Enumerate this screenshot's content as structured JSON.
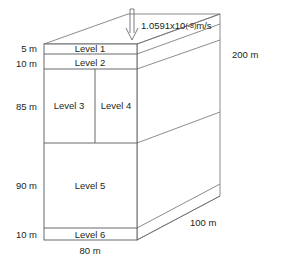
{
  "figure": {
    "type": "3d-box-schematic",
    "title": ""
  },
  "flux": {
    "arrow_icon": "down-arrow-icon",
    "mantissa": "1.0591x10",
    "exponent": "(-8)",
    "unit": "m/s",
    "full_label": "1.0591x10(-8)m/s"
  },
  "levels": [
    {
      "id": "level-1",
      "label": "Level 1",
      "thickness": "5 m"
    },
    {
      "id": "level-2",
      "label": "Level 2",
      "thickness": "10 m"
    },
    {
      "id": "level-3",
      "label": "Level 3",
      "thickness": "85 m"
    },
    {
      "id": "level-4",
      "label": "Level 4",
      "thickness": "85 m"
    },
    {
      "id": "level-5",
      "label": "Level 5",
      "thickness": "90 m"
    },
    {
      "id": "level-6",
      "label": "Level 6",
      "thickness": "10 m"
    }
  ],
  "left_dimensions": [
    {
      "value": "5 m"
    },
    {
      "value": "10 m"
    },
    {
      "value": "85 m"
    },
    {
      "value": "90 m"
    },
    {
      "value": "10 m"
    }
  ],
  "dimensions": {
    "width": "80 m",
    "height": "200 m",
    "depth": "100 m"
  },
  "colors": {
    "stroke": "#6d6e71",
    "front_stroke": "#58595b",
    "text": "#231f20",
    "background": "#ffffff"
  }
}
